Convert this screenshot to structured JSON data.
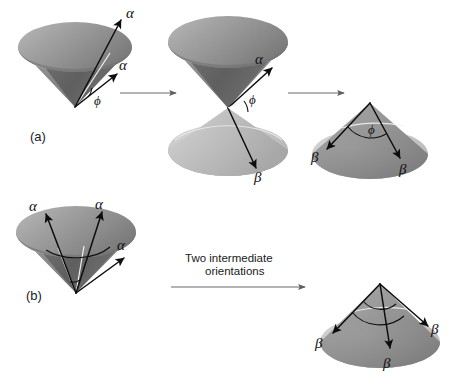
{
  "figure": {
    "background_color": "#ffffff",
    "panels": [
      {
        "id": "a",
        "label": "(a)"
      },
      {
        "id": "b",
        "label": "(b)"
      }
    ],
    "row_a": {
      "cone_left": {
        "name": "single-cone-apex-down",
        "labels": [
          {
            "text": "α",
            "role": "generator-vector-outer"
          },
          {
            "text": "α",
            "role": "generator-vector-inner"
          },
          {
            "text": "ϕ",
            "role": "azimuth-angle"
          }
        ]
      },
      "cone_middle": {
        "name": "double-cone-hourglass",
        "labels": [
          {
            "text": "α",
            "role": "upper-cone-vector"
          },
          {
            "text": "ϕ",
            "role": "azimuth-angle"
          },
          {
            "text": "β",
            "role": "lower-cone-vector"
          }
        ]
      },
      "cone_right": {
        "name": "single-cone-apex-up",
        "labels": [
          {
            "text": "β",
            "role": "left-vector"
          },
          {
            "text": "ϕ",
            "role": "azimuth-angle"
          },
          {
            "text": "β",
            "role": "right-vector"
          }
        ]
      },
      "arrows": [
        {
          "name": "transition-arrow-1",
          "direction": "right"
        },
        {
          "name": "transition-arrow-2",
          "direction": "right"
        }
      ]
    },
    "row_b": {
      "cone_left": {
        "name": "single-cone-apex-down-three-vectors",
        "labels": [
          {
            "text": "α",
            "role": "vector-left"
          },
          {
            "text": "α",
            "role": "vector-top"
          },
          {
            "text": "α",
            "role": "vector-right"
          }
        ]
      },
      "cone_right": {
        "name": "single-cone-apex-up-three-vectors",
        "labels": [
          {
            "text": "β",
            "role": "vector-left"
          },
          {
            "text": "β",
            "role": "vector-center"
          },
          {
            "text": "β",
            "role": "vector-right"
          }
        ]
      },
      "arrow": {
        "name": "intermediate-orientations-arrow",
        "direction": "right",
        "caption_line1": "Two intermediate",
        "caption_line2": "orientations"
      }
    },
    "colors": {
      "surface_mid": "#8c8c8c",
      "surface_dark": "#666666",
      "surface_light": "#c9c9c9",
      "surface_highlight": "#d8d8d8",
      "stroke": "#0d0d0d",
      "arrow_gray": "#6b6b6b",
      "text": "#1a1a1a"
    }
  }
}
